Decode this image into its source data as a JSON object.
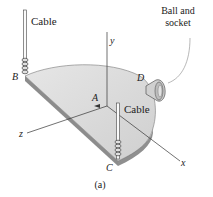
{
  "figure": {
    "caption": "(a)",
    "labels": {
      "cable_b": "Cable",
      "cable_c": "Cable",
      "ball_socket_line1": "Ball and",
      "ball_socket_line2": "socket",
      "point_a": "A",
      "point_b": "B",
      "point_c": "C",
      "point_d": "D",
      "axis_x": "x",
      "axis_y": "y",
      "axis_z": "z"
    },
    "colors": {
      "plate_top": "#d9d9d9",
      "plate_edge": "#8c8c8c",
      "line": "#333333",
      "background": "#ffffff"
    }
  }
}
